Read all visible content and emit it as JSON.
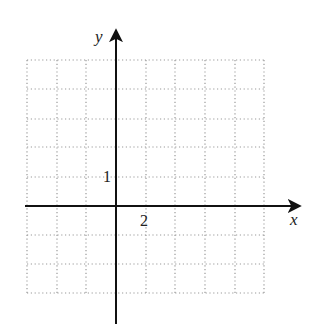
{
  "figure": {
    "type": "coordinate-grid",
    "axes": {
      "x_label": "x",
      "y_label": "y",
      "x_tick_label": "2",
      "y_tick_label": "1"
    },
    "grid": {
      "columns": 8,
      "rows": 8,
      "style": "dotted",
      "x_unit_per_cell": 2,
      "y_unit_per_cell": 1,
      "x_range": [
        -6,
        10
      ],
      "y_range": [
        -3,
        5
      ]
    },
    "colors": {
      "axis": "#111111",
      "grid": "#9a9a9a",
      "text": "#222222"
    }
  }
}
